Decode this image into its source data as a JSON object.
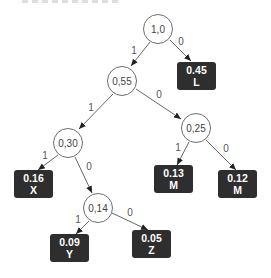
{
  "diagram": {
    "type": "huffman-tree",
    "colors": {
      "node_border": "#6e6e6e",
      "node_fill": "#ffffff",
      "leaf_fill": "#2e2e2e",
      "leaf_text": "#ffffff",
      "edge": "#555555"
    },
    "nodes": {
      "root": {
        "label": "1,0"
      },
      "n055": {
        "label": "0,55"
      },
      "n025": {
        "label": "0,25"
      },
      "n030": {
        "label": "0,30"
      },
      "n014": {
        "label": "0,14"
      }
    },
    "leaves": {
      "L": {
        "value": "0.45",
        "symbol": "L"
      },
      "X": {
        "value": "0.16",
        "symbol": "X"
      },
      "M1": {
        "value": "0.13",
        "symbol": "M"
      },
      "M2": {
        "value": "0.12",
        "symbol": "M"
      },
      "Y": {
        "value": "0.09",
        "symbol": "Y"
      },
      "Z": {
        "value": "0.05",
        "symbol": "Z"
      }
    },
    "edges": {
      "root_n055": "1",
      "root_L": "0",
      "n055_n030": "1",
      "n055_n025": "0",
      "n030_X": "1",
      "n030_n014": "0",
      "n025_M1": "1",
      "n025_M2": "0",
      "n014_Y": "1",
      "n014_Z": "0"
    }
  }
}
